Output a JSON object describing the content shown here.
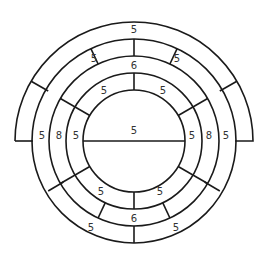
{
  "diagram": {
    "type": "concentric-ring-diagram",
    "center": [
      134,
      141
    ],
    "colors": {
      "stroke": "#1a1a1a",
      "text": "#333333",
      "background": "#ffffff"
    },
    "labels": {
      "outer_top": "5",
      "ring3_top_left": "5",
      "ring3_top_right": "5",
      "ring2_top": "6",
      "ring1_top_left": "5",
      "ring1_top_right": "5",
      "center": "5",
      "left_ring1": "5",
      "left_ring2": "8",
      "left_outer": "5",
      "right_ring1": "5",
      "right_ring2": "8",
      "right_outer": "5",
      "ring1_bottom_left": "5",
      "ring1_bottom_right": "5",
      "ring2_bottom": "6",
      "ring3_bottom_left": "5",
      "ring3_bottom_right": "5"
    }
  }
}
